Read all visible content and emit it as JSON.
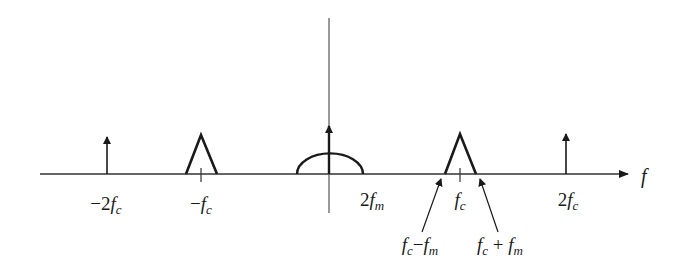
{
  "diagram": {
    "type": "frequency-spectrum",
    "axis": {
      "horizontal_label": "f",
      "has_vertical_axis": true
    },
    "components": [
      {
        "kind": "impulse",
        "position": "-2fc",
        "label": {
          "prefix": "−2",
          "var": "f",
          "sub": "c"
        }
      },
      {
        "kind": "triangle",
        "position": "-fc",
        "label": {
          "prefix": "−",
          "var": "f",
          "sub": "c"
        }
      },
      {
        "kind": "half-ellipse-with-impulse",
        "position": "0",
        "edge_label": {
          "prefix": "2",
          "var": "f",
          "sub": "m"
        }
      },
      {
        "kind": "triangle",
        "position": "fc",
        "label": {
          "prefix": "",
          "var": "f",
          "sub": "c"
        }
      },
      {
        "kind": "impulse",
        "position": "2fc",
        "label": {
          "prefix": "2",
          "var": "f",
          "sub": "c"
        }
      }
    ],
    "annotations": [
      {
        "text": "fc − fm",
        "parts": {
          "v1": "f",
          "s1": "c",
          "op": "−",
          "v2": "f",
          "s2": "m"
        }
      },
      {
        "text": "fc + fm",
        "parts": {
          "v1": "f",
          "s1": "c",
          "op": "+",
          "v2": "f",
          "s2": "m"
        }
      }
    ],
    "colors": {
      "stroke": "#1a1a1a",
      "background": "#ffffff"
    }
  }
}
